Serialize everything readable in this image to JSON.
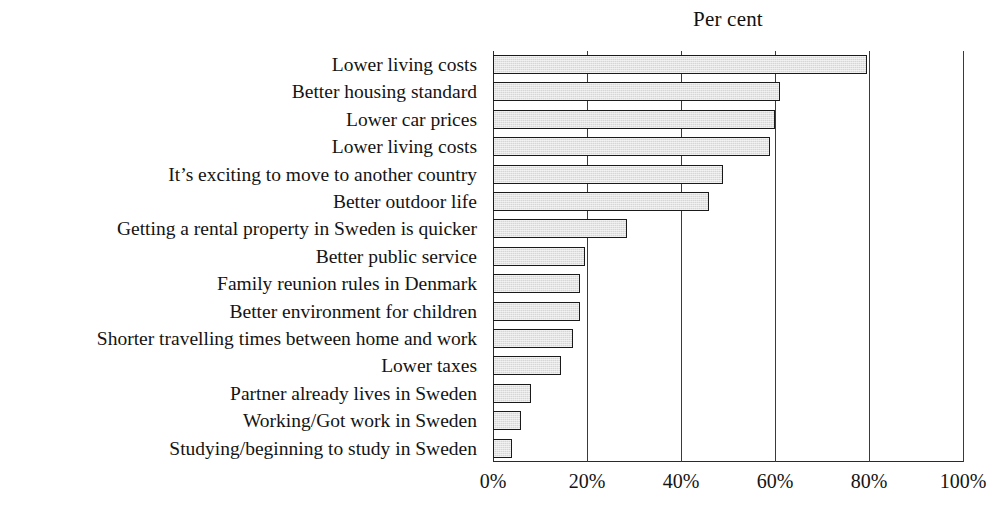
{
  "chart_data": {
    "type": "bar",
    "orientation": "horizontal",
    "title": "Per cent",
    "xlabel": "",
    "ylabel": "",
    "xlim": [
      0,
      100
    ],
    "grid": true,
    "legend": false,
    "xticks": [
      {
        "value": 0,
        "label": "0%"
      },
      {
        "value": 20,
        "label": "20%"
      },
      {
        "value": 40,
        "label": "40%"
      },
      {
        "value": 60,
        "label": "60%"
      },
      {
        "value": 80,
        "label": "80%"
      },
      {
        "value": 100,
        "label": "100%"
      }
    ],
    "categories": [
      "Lower living costs",
      "Better housing standard",
      "Lower car prices",
      "Lower living costs",
      "It’s exciting to move to another country",
      "Better outdoor life",
      "Getting a rental property in Sweden is quicker",
      "Better public service",
      "Family reunion rules in Denmark",
      "Better environment for children",
      "Shorter travelling times between home and work",
      "Lower taxes",
      "Partner already lives in Sweden",
      "Working/Got work in Sweden",
      "Studying/beginning to study in Sweden"
    ],
    "values": [
      79.5,
      61,
      60,
      59,
      49,
      46,
      28.5,
      19.5,
      18.5,
      18.5,
      17,
      14.5,
      8,
      6,
      4
    ],
    "colors": {
      "bar_fill": "#d6d6d6",
      "bar_border": "#1a1a1a",
      "gridline": "#3a3a3a",
      "axis": "#2a2a2a",
      "text": "#141414",
      "background": "#ffffff"
    }
  }
}
